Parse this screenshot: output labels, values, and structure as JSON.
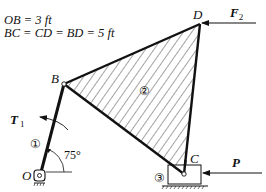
{
  "given": {
    "line1": "OB = 3 ft",
    "line2": "BC = CD = BD = 5 ft"
  },
  "points": {
    "O": "O",
    "B": "B",
    "C": "C",
    "D": "D"
  },
  "members": {
    "link1": "①",
    "plate2": "②",
    "slider3": "③"
  },
  "loads": {
    "torque": "T",
    "torque_sub": "1",
    "force_D": "F",
    "force_D_sub": "2",
    "force_C": "P"
  },
  "angle": "75°",
  "colors": {
    "ink": "#111111",
    "background": "#ffffff"
  }
}
